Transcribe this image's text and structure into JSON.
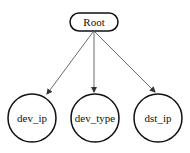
{
  "diagram": {
    "type": "tree",
    "root": {
      "id": "root",
      "label": "Root",
      "shape": "rounded-rect"
    },
    "children": [
      {
        "id": "dev_ip",
        "label": "dev_ip",
        "shape": "circle"
      },
      {
        "id": "dev_type",
        "label": "dev_type",
        "shape": "circle"
      },
      {
        "id": "dst_ip",
        "label": "dst_ip",
        "shape": "circle"
      }
    ],
    "edges": [
      {
        "from": "Root",
        "to": "dev_ip"
      },
      {
        "from": "Root",
        "to": "dev_type"
      },
      {
        "from": "Root",
        "to": "dst_ip"
      }
    ]
  }
}
